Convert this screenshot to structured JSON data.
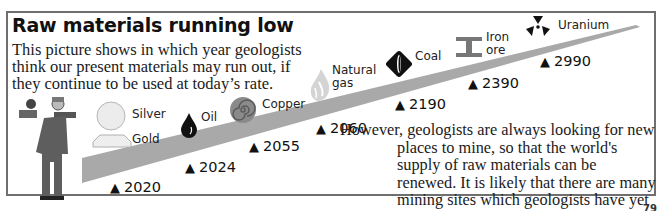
{
  "title": "Raw materials running low",
  "intro": "This picture shows in which year geologists think our present materials may run out, if they continue to be used at today’s rate.",
  "outro": "However, geologists are always looking for new places to mine, so that the world's supply of raw materials can be renewed. It is likely that there are many mining sites which geologists have yet to discover.",
  "materials": [
    {
      "name": "Silver",
      "icon": "silver-disc-icon"
    },
    {
      "name": "Gold",
      "icon": "gold-bar-icon"
    },
    {
      "name": "Oil",
      "icon": "oil-drop-icon"
    },
    {
      "name": "Copper",
      "icon": "copper-spiral-icon"
    },
    {
      "name": "Natural gas",
      "line1": "Natural",
      "line2": "gas",
      "icon": "gas-flame-icon"
    },
    {
      "name": "Coal",
      "icon": "coal-diamond-icon"
    },
    {
      "name": "Iron ore",
      "line1": "Iron",
      "line2": "ore",
      "icon": "iron-girder-icon"
    },
    {
      "name": "Uranium",
      "icon": "radiation-icon"
    }
  ],
  "years": [
    {
      "material": "Silver/Gold",
      "year": "2020"
    },
    {
      "material": "Oil",
      "year": "2024"
    },
    {
      "material": "Copper",
      "year": "2055"
    },
    {
      "material": "Natural gas",
      "year": "2060"
    },
    {
      "material": "Coal",
      "year": "2190"
    },
    {
      "material": "Iron ore",
      "year": "2390"
    },
    {
      "material": "Uranium",
      "year": "2990"
    }
  ],
  "marker_symbol": "▲",
  "page_number": "79",
  "colors": {
    "band": "#a9a9a9",
    "frame": "#6f6f6f",
    "text": "#1b1b1b"
  }
}
